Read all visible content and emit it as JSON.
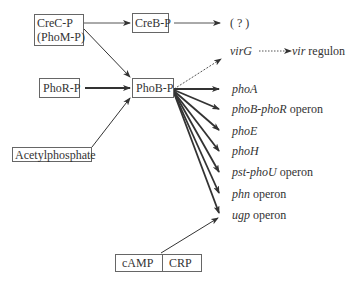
{
  "nodes": {
    "crec": {
      "line1": "CreC-P",
      "line2": "(PhoM-P)"
    },
    "creb": "CreB-P",
    "unknown": "( ? )",
    "phor": "PhoR-P",
    "phob": "PhoB-P",
    "acetyl": "Acetylphosphate",
    "camp": "cAMP",
    "crp": "CRP"
  },
  "vir": {
    "virG": "virG",
    "vir": "vir",
    "regulon": "regulon"
  },
  "targets": [
    {
      "gene": "phoA",
      "suffix": ""
    },
    {
      "gene": "phoB-phoR",
      "suffix": "operon"
    },
    {
      "gene": "phoE",
      "suffix": ""
    },
    {
      "gene": "phoH",
      "suffix": ""
    },
    {
      "gene": "pst-phoU",
      "suffix": "operon"
    },
    {
      "gene": "phn",
      "suffix": "operon"
    },
    {
      "gene": "ugp",
      "suffix": "operon"
    }
  ],
  "colors": {
    "line": "#333333",
    "box_border": "#666666"
  }
}
